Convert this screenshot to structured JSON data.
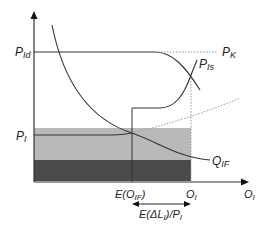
{
  "diagram": {
    "labels": {
      "p_id": "P",
      "p_id_sub": "Id",
      "p_k": "P",
      "p_k_sub": "K",
      "p_is": "P",
      "p_is_sub": "Is",
      "p_i": "P",
      "p_i_sub": "I",
      "q_if": "Q",
      "q_if_sub": "IF",
      "e_oif_pre": "E(O",
      "e_oif_sub": "IF",
      "e_oif_post": ")",
      "o_i_tick": "O",
      "o_i_tick_sub": "I",
      "o_i_axis": "O",
      "o_i_axis_sub": "I",
      "e_dl_pre": "E(ΔL",
      "e_dl_sub": "I",
      "e_dl_mid": ")/P",
      "e_dl_sub2": "I"
    },
    "colors": {
      "background": "#ffffff",
      "axis": "#333333",
      "curve": "#333333",
      "dotted": "#9a9a9a",
      "band_light": "#b9b9b9",
      "band_dark": "#4a4a4a"
    }
  }
}
